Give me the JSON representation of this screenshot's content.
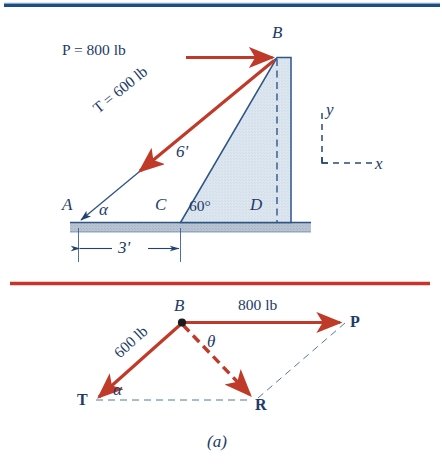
{
  "figure": {
    "caption": "(a)",
    "colors": {
      "navy": "#1d3b66",
      "line_navy": "#2f5585",
      "red": "#c0392b",
      "vector_red": "#c03a2a",
      "wall_fill": "#dce6ef",
      "ground_fill": "#b9c4d2",
      "rule_navy": "#1c4e86",
      "rule_red": "#c8332a"
    }
  },
  "top_diagram": {
    "name": "wall-cable-free-body",
    "points": {
      "A": "A",
      "B": "B",
      "C": "C",
      "D": "D"
    },
    "force_P_label": "P = 800 lb",
    "force_T_label": "T = 600 lb",
    "height_label": "6'",
    "angle_alpha": "α",
    "angle_60": "60°",
    "dimension_label": "3'",
    "axis_x": "x",
    "axis_y": "y",
    "values": {
      "P_magnitude": 800,
      "T_magnitude": 600,
      "units": "lb",
      "wall_face_length": 6,
      "wall_face_units": "ft",
      "base_distance": 3,
      "base_distance_units": "ft",
      "wall_angle_deg": 60
    }
  },
  "bottom_diagram": {
    "name": "parallelogram-vector-addition",
    "point_B": "B",
    "vector_P": "P",
    "vector_T": "T",
    "vector_R": "R",
    "magnitude_P": "800 lb",
    "magnitude_T": "600 lb",
    "angle_theta": "θ",
    "angle_alpha": "α",
    "values": {
      "P_magnitude": 800,
      "T_magnitude": 600,
      "units": "lb"
    }
  }
}
